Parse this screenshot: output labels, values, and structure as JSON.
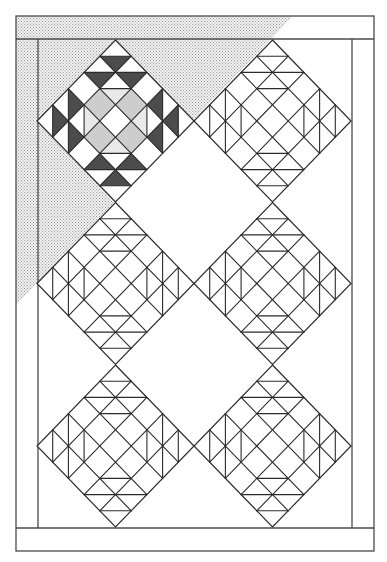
{
  "diagram": {
    "title": "Quilt layout diagram",
    "width": 387,
    "height": 562,
    "colors": {
      "background": "#ffffff",
      "line": "#2b2b2b",
      "frame_line": "#4a4a4a",
      "dark_fill": "#4c4c4c",
      "medium_fill": "#cdcdcd",
      "light_fill": "#e9e9e9",
      "stipple_dot": "#9a9a9a",
      "stipple_bg": "#f2f2f2"
    },
    "frame": {
      "outer": {
        "x1": 16,
        "y1": 16,
        "x2": 374,
        "y2": 551
      },
      "top_border_bottom_y": 39,
      "bottom_border_top_y": 528,
      "left_border_inner_x": 38,
      "right_border_inner_x": 352
    },
    "stipple_region": {
      "label": "shaded-corner",
      "points": [
        [
          16,
          16
        ],
        [
          293,
          16
        ],
        [
          16,
          305
        ]
      ]
    },
    "block_geometry": {
      "steps": 5,
      "half_width": 78.5,
      "half_height": 81,
      "horizontal_segments": [
        {
          "t": -4,
          "s1": -1,
          "s2": 1
        },
        {
          "t": -3,
          "s1": -2,
          "s2": 2
        },
        {
          "t": -2,
          "s1": -1,
          "s2": 1
        },
        {
          "t": 2,
          "s1": -1,
          "s2": 1
        },
        {
          "t": 3,
          "s1": -2,
          "s2": 2
        },
        {
          "t": 4,
          "s1": -1,
          "s2": 1
        }
      ],
      "vertical_segments": [
        {
          "s": -4,
          "t1": -1,
          "t2": 1
        },
        {
          "s": -3,
          "t1": -2,
          "t2": 2
        },
        {
          "s": -2,
          "t1": -1,
          "t2": 1
        },
        {
          "s": 2,
          "t1": -1,
          "t2": 1
        },
        {
          "s": 3,
          "t1": -2,
          "t2": 2
        },
        {
          "s": 4,
          "t1": -1,
          "t2": 1
        }
      ],
      "diagonal_sum_values": [
        -3,
        -1,
        1,
        3
      ],
      "diagonal_diff_values": [
        -3,
        -1,
        1,
        3
      ]
    },
    "colored_block_fills": [
      {
        "tone": "dark",
        "pts": [
          [
            -1,
            -4
          ],
          [
            1,
            -4
          ],
          [
            0,
            -3
          ]
        ]
      },
      {
        "tone": "dark",
        "pts": [
          [
            -2,
            -3
          ],
          [
            0,
            -3
          ],
          [
            -1,
            -2
          ]
        ]
      },
      {
        "tone": "dark",
        "pts": [
          [
            0,
            -3
          ],
          [
            2,
            -3
          ],
          [
            1,
            -2
          ]
        ]
      },
      {
        "tone": "dark",
        "pts": [
          [
            -1,
            4
          ],
          [
            1,
            4
          ],
          [
            0,
            3
          ]
        ]
      },
      {
        "tone": "dark",
        "pts": [
          [
            -2,
            3
          ],
          [
            0,
            3
          ],
          [
            -1,
            2
          ]
        ]
      },
      {
        "tone": "dark",
        "pts": [
          [
            0,
            3
          ],
          [
            2,
            3
          ],
          [
            1,
            2
          ]
        ]
      },
      {
        "tone": "dark",
        "pts": [
          [
            -4,
            -1
          ],
          [
            -4,
            1
          ],
          [
            -3,
            0
          ]
        ]
      },
      {
        "tone": "dark",
        "pts": [
          [
            -3,
            -2
          ],
          [
            -3,
            0
          ],
          [
            -2,
            -1
          ]
        ]
      },
      {
        "tone": "dark",
        "pts": [
          [
            -3,
            0
          ],
          [
            -3,
            2
          ],
          [
            -2,
            1
          ]
        ]
      },
      {
        "tone": "dark",
        "pts": [
          [
            4,
            -1
          ],
          [
            4,
            1
          ],
          [
            3,
            0
          ]
        ]
      },
      {
        "tone": "dark",
        "pts": [
          [
            3,
            -2
          ],
          [
            3,
            0
          ],
          [
            2,
            -1
          ]
        ]
      },
      {
        "tone": "dark",
        "pts": [
          [
            3,
            0
          ],
          [
            3,
            2
          ],
          [
            2,
            1
          ]
        ]
      },
      {
        "tone": "medium",
        "pts": [
          [
            -1,
            -2
          ],
          [
            0,
            -1
          ],
          [
            -1,
            0
          ],
          [
            -2,
            -1
          ]
        ]
      },
      {
        "tone": "medium",
        "pts": [
          [
            1,
            -2
          ],
          [
            2,
            -1
          ],
          [
            1,
            0
          ],
          [
            0,
            -1
          ]
        ]
      },
      {
        "tone": "medium",
        "pts": [
          [
            -2,
            1
          ],
          [
            -1,
            0
          ],
          [
            0,
            1
          ],
          [
            -1,
            2
          ]
        ]
      },
      {
        "tone": "medium",
        "pts": [
          [
            2,
            1
          ],
          [
            1,
            2
          ],
          [
            0,
            1
          ],
          [
            1,
            0
          ]
        ]
      },
      {
        "tone": "light",
        "pts": [
          [
            -1,
            -2
          ],
          [
            1,
            -2
          ],
          [
            0,
            -1
          ]
        ]
      },
      {
        "tone": "light",
        "pts": [
          [
            -1,
            2
          ],
          [
            1,
            2
          ],
          [
            0,
            1
          ]
        ]
      },
      {
        "tone": "light",
        "pts": [
          [
            -2,
            -1
          ],
          [
            -2,
            1
          ],
          [
            -1,
            0
          ]
        ]
      },
      {
        "tone": "light",
        "pts": [
          [
            2,
            -1
          ],
          [
            2,
            1
          ],
          [
            1,
            0
          ]
        ]
      }
    ],
    "blocks": [
      {
        "id": "block-r1-c1",
        "row": 1,
        "col": 1,
        "cx": 115.5,
        "cy": 121,
        "style": "colored"
      },
      {
        "id": "block-r1-c2",
        "row": 1,
        "col": 2,
        "cx": 272.5,
        "cy": 121,
        "style": "outline"
      },
      {
        "id": "block-r2-c1",
        "row": 2,
        "col": 1,
        "cx": 115.5,
        "cy": 283.5,
        "style": "outline"
      },
      {
        "id": "block-r2-c2",
        "row": 2,
        "col": 2,
        "cx": 272.5,
        "cy": 283.5,
        "style": "outline"
      },
      {
        "id": "block-r3-c1",
        "row": 3,
        "col": 1,
        "cx": 115.5,
        "cy": 446,
        "style": "outline"
      },
      {
        "id": "block-r3-c2",
        "row": 3,
        "col": 2,
        "cx": 272.5,
        "cy": 446,
        "style": "outline"
      }
    ]
  }
}
